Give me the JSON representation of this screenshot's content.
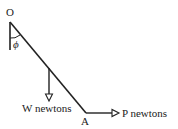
{
  "diagram": {
    "points": {
      "pivot_label": "O",
      "end_label": "A"
    },
    "angle_label": "ϕ",
    "forces": {
      "weight_label": "W newtons",
      "horizontal_label": "P newtons"
    },
    "colors": {
      "line": "#222222",
      "background": "#ffffff"
    }
  }
}
